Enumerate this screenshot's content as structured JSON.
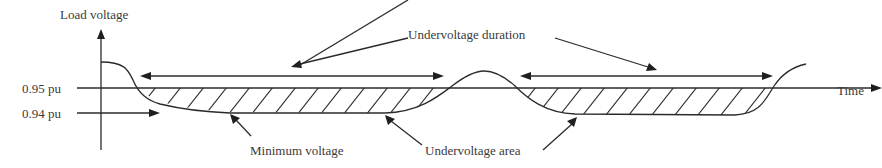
{
  "diagram": {
    "y_axis_label": "Load voltage",
    "x_axis_label": "Time",
    "levels": [
      {
        "label": "0.95 pu",
        "value": 0.95
      },
      {
        "label": "0.94 pu",
        "value": 0.94
      }
    ],
    "annotations": {
      "duration": "Undervoltage duration",
      "minimum": "Minimum voltage",
      "area": "Undervoltage area"
    },
    "colors": {
      "line": "#2b2b2b",
      "text": "#3a3a3a",
      "background": "#ffffff"
    }
  }
}
